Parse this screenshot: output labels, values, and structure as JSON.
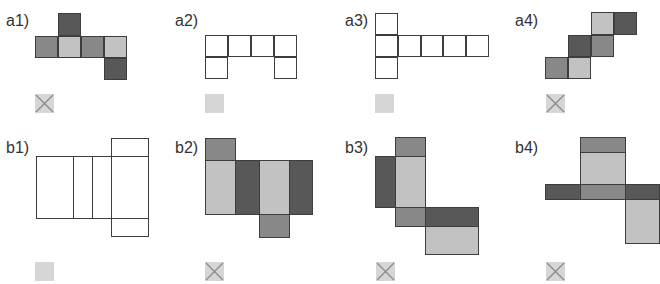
{
  "colors": {
    "dark": "#585858",
    "medium": "#888888",
    "light": "#c2c2c2",
    "white": "#ffffff",
    "border": "#3d3d3d",
    "marker_fill": "#d6d6d6",
    "marker_cross": "#8a8a8a"
  },
  "panels": [
    {
      "id": "a1",
      "label": "a1)",
      "label_pos": [
        6,
        13
      ],
      "marker": {
        "type": "cross",
        "pos": [
          35,
          94
        ]
      },
      "cells": [
        [
          58,
          13,
          23,
          23,
          "dark"
        ],
        [
          35,
          36,
          23,
          22,
          "medium"
        ],
        [
          58,
          36,
          23,
          22,
          "light"
        ],
        [
          81,
          36,
          23,
          22,
          "medium"
        ],
        [
          104,
          36,
          23,
          22,
          "light"
        ],
        [
          104,
          58,
          23,
          22,
          "dark"
        ]
      ]
    },
    {
      "id": "a2",
      "label": "a2)",
      "label_pos": [
        175,
        13
      ],
      "marker": {
        "type": "plain",
        "pos": [
          205,
          94
        ]
      },
      "cells": [
        [
          205,
          35,
          23,
          22,
          "white"
        ],
        [
          228,
          35,
          23,
          22,
          "white"
        ],
        [
          251,
          35,
          23,
          22,
          "white"
        ],
        [
          274,
          35,
          23,
          22,
          "white"
        ],
        [
          205,
          57,
          23,
          22,
          "white"
        ],
        [
          274,
          57,
          23,
          22,
          "white"
        ]
      ]
    },
    {
      "id": "a3",
      "label": "a3)",
      "label_pos": [
        345,
        13
      ],
      "marker": {
        "type": "plain",
        "pos": [
          375,
          94
        ]
      },
      "cells": [
        [
          375,
          13,
          23,
          22,
          "white"
        ],
        [
          375,
          35,
          23,
          22,
          "white"
        ],
        [
          398,
          35,
          23,
          22,
          "white"
        ],
        [
          421,
          35,
          22,
          22,
          "white"
        ],
        [
          443,
          35,
          23,
          22,
          "white"
        ],
        [
          466,
          35,
          23,
          22,
          "white"
        ],
        [
          375,
          57,
          23,
          22,
          "white"
        ]
      ]
    },
    {
      "id": "a4",
      "label": "a4)",
      "label_pos": [
        515,
        13
      ],
      "marker": {
        "type": "cross",
        "pos": [
          546,
          94
        ]
      },
      "cells": [
        [
          591,
          12,
          23,
          23,
          "light"
        ],
        [
          614,
          12,
          23,
          23,
          "dark"
        ],
        [
          568,
          35,
          23,
          22,
          "dark"
        ],
        [
          591,
          35,
          23,
          22,
          "medium"
        ],
        [
          545,
          57,
          23,
          22,
          "medium"
        ],
        [
          568,
          57,
          23,
          22,
          "light"
        ]
      ]
    },
    {
      "id": "b1",
      "label": "b1)",
      "label_pos": [
        6,
        140
      ],
      "marker": {
        "type": "plain",
        "pos": [
          35,
          262
        ]
      },
      "cells": [
        [
          111,
          138,
          38,
          19,
          "white"
        ],
        [
          36,
          156,
          38,
          63,
          "white"
        ],
        [
          73,
          156,
          20,
          63,
          "white"
        ],
        [
          92,
          156,
          20,
          63,
          "white"
        ],
        [
          111,
          156,
          38,
          63,
          "white"
        ],
        [
          111,
          218,
          38,
          19,
          "white"
        ]
      ]
    },
    {
      "id": "b2",
      "label": "b2)",
      "label_pos": [
        175,
        140
      ],
      "marker": {
        "type": "cross",
        "pos": [
          205,
          262
        ]
      },
      "cells": [
        [
          205,
          138,
          31,
          23,
          "medium"
        ],
        [
          205,
          160,
          31,
          55,
          "light"
        ],
        [
          235,
          160,
          25,
          55,
          "dark"
        ],
        [
          259,
          160,
          31,
          55,
          "light"
        ],
        [
          289,
          160,
          24,
          55,
          "dark"
        ],
        [
          259,
          214,
          31,
          24,
          "medium"
        ]
      ]
    },
    {
      "id": "b3",
      "label": "b3)",
      "label_pos": [
        345,
        140
      ],
      "marker": {
        "type": "cross",
        "pos": [
          376,
          262
        ]
      },
      "cells": [
        [
          395,
          137,
          31,
          20,
          "medium"
        ],
        [
          375,
          156,
          21,
          52,
          "dark"
        ],
        [
          395,
          156,
          31,
          52,
          "light"
        ],
        [
          395,
          207,
          31,
          20,
          "medium"
        ],
        [
          425,
          207,
          54,
          20,
          "dark"
        ],
        [
          425,
          226,
          54,
          29,
          "light"
        ]
      ]
    },
    {
      "id": "b4",
      "label": "b4)",
      "label_pos": [
        515,
        140
      ],
      "marker": {
        "type": "cross",
        "pos": [
          546,
          262
        ]
      },
      "cells": [
        [
          580,
          137,
          46,
          16,
          "medium"
        ],
        [
          580,
          152,
          46,
          33,
          "light"
        ],
        [
          545,
          184,
          36,
          16,
          "dark"
        ],
        [
          580,
          184,
          46,
          16,
          "medium"
        ],
        [
          625,
          184,
          35,
          16,
          "dark"
        ],
        [
          625,
          199,
          35,
          45,
          "light"
        ]
      ]
    }
  ]
}
